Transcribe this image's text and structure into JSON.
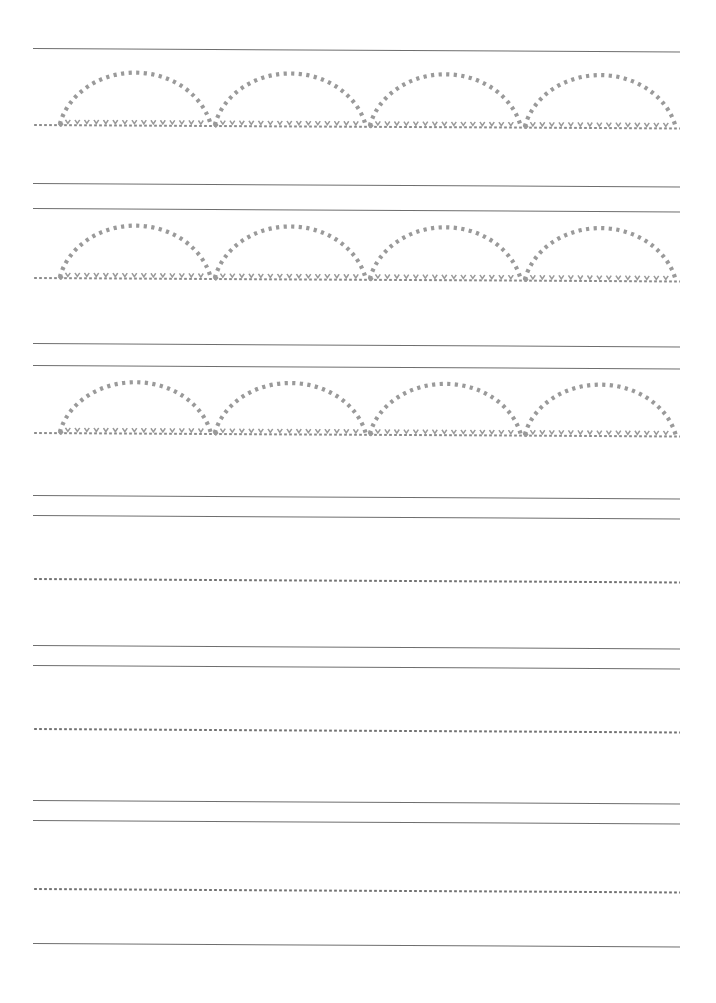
{
  "page": {
    "type": "tracing-worksheet",
    "width": 716,
    "height": 1003,
    "background_color": "#ffffff",
    "paper_skew_degrees": 0.3
  },
  "ink": {
    "solid_line_color": "#6e6e6e",
    "dotted_line_color": "#707070",
    "trace_shape_color": "#9a9a9a",
    "tick_mark_color": "#9a9a9a"
  },
  "ruling": {
    "left_margin_px": 33,
    "right_margin_px": 680,
    "line_width_px": 647,
    "solid_line_thickness_px": 1,
    "dot_pitch_px": 5
  },
  "trace_shape": {
    "name": "arch",
    "description": "dotted semicircular arch stroke",
    "count_per_row": 4,
    "width_px": 155,
    "height_px": 67,
    "stroke_style": "dotted",
    "stroke_width_px": 4.2,
    "has_baseline_ticks": true,
    "has_start_marker": true
  },
  "rows": [
    {
      "index": 1,
      "kind": "guided-trace",
      "top_solid_y": 48,
      "has_second_solid": false,
      "baseline_y": 124,
      "arch_top_y": 57,
      "arch_starts_x": [
        25,
        180,
        335,
        490
      ],
      "arch_count": 4
    },
    {
      "index": 2,
      "kind": "guided-trace",
      "top_solid_y": 183,
      "second_solid_y": 208,
      "has_second_solid": true,
      "baseline_y": 277,
      "arch_top_y": 210,
      "arch_starts_x": [
        25,
        180,
        335,
        490
      ],
      "arch_count": 4
    },
    {
      "index": 3,
      "kind": "guided-trace",
      "top_solid_y": 343,
      "second_solid_y": 365,
      "has_second_solid": true,
      "baseline_y": 432,
      "arch_top_y": 367,
      "arch_starts_x": [
        25,
        180,
        335,
        490
      ],
      "arch_count": 4
    },
    {
      "index": 4,
      "kind": "blank-practice",
      "top_solid_y": 495,
      "second_solid_y": 515,
      "has_second_solid": true,
      "baseline_y": 578,
      "arch_count": 0
    },
    {
      "index": 5,
      "kind": "blank-practice",
      "top_solid_y": 645,
      "second_solid_y": 665,
      "has_second_solid": true,
      "baseline_y": 728,
      "arch_count": 0
    },
    {
      "index": 6,
      "kind": "blank-practice",
      "top_solid_y": 800,
      "second_solid_y": 820,
      "has_second_solid": true,
      "baseline_y": 888,
      "arch_count": 0
    },
    {
      "index": 7,
      "kind": "blank-practice",
      "top_solid_y": 943,
      "has_second_solid": false,
      "baseline_y": null,
      "arch_count": 0
    }
  ]
}
